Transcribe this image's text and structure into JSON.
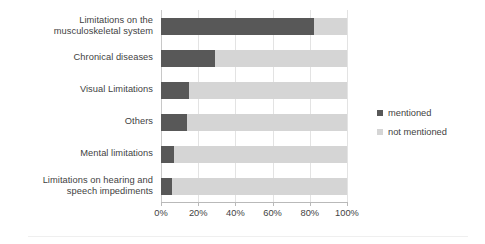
{
  "chart_data": {
    "type": "bar",
    "subtype": "horizontal-stacked-100-percent",
    "title": "",
    "subtitle": "",
    "xlabel": "",
    "ylabel": "",
    "xlim": [
      0,
      100
    ],
    "xticks": [
      0,
      20,
      40,
      60,
      80,
      100
    ],
    "xticklabels": [
      "0%",
      "20%",
      "40%",
      "60%",
      "80%",
      "100%"
    ],
    "grid": "vertical",
    "legend_position": "right",
    "categories": [
      "Limitations on the\nmusculoskeletal system",
      "Chronical diseases",
      "Visual Limitations",
      "Others",
      "Mental limitations",
      "Limitations on hearing and\nspeech impediments"
    ],
    "category_lines": [
      [
        "Limitations on the",
        "musculoskeletal system"
      ],
      [
        "Chronical diseases"
      ],
      [
        "Visual Limitations"
      ],
      [
        "Others"
      ],
      [
        "Mental limitations"
      ],
      [
        "Limitations on hearing and",
        "speech impediments"
      ]
    ],
    "series": [
      {
        "name": "mentioned",
        "color": "#585858",
        "values": [
          82,
          29,
          15,
          14,
          7,
          6
        ]
      },
      {
        "name": "not mentioned",
        "color": "#d5d5d5",
        "values": [
          18,
          71,
          85,
          86,
          93,
          94
        ]
      }
    ]
  },
  "legend": {
    "entries": [
      {
        "label": "mentioned",
        "color": "#585858"
      },
      {
        "label": "not mentioned",
        "color": "#d5d5d5"
      }
    ]
  },
  "colors": {
    "mentioned": "#585858",
    "not_mentioned": "#d5d5d5",
    "gridline": "#e3e3e3",
    "axis": "#b9b9b9",
    "text": "#3f3f3f",
    "background": "#ffffff"
  }
}
